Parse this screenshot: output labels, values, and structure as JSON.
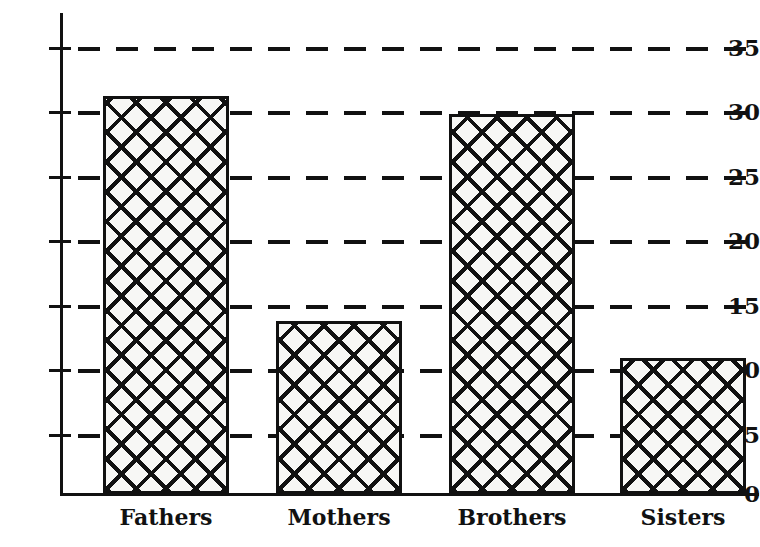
{
  "chart_data": {
    "type": "bar",
    "title": "",
    "subtitle": "",
    "xlabel": "",
    "ylabel": "",
    "categories": [
      "Fathers",
      "Mothers",
      "Brothers",
      "Sisters"
    ],
    "values": [
      31.2,
      13.6,
      29.8,
      10.7
    ],
    "series": [
      {
        "name": "",
        "values": [
          31.2,
          13.6,
          29.8,
          10.7
        ]
      }
    ],
    "ylim": [
      0,
      36
    ],
    "y_ticks": [
      0,
      5,
      10,
      15,
      20,
      25,
      30,
      35
    ],
    "y_tick_labels": [
      "0",
      "5",
      "10",
      "15",
      "20",
      "25",
      "30",
      "35"
    ],
    "grid": "horizontal-dashed",
    "gridlines_at": [
      5,
      10,
      15,
      20,
      25,
      30,
      35
    ],
    "legend": "none",
    "legend_position": "",
    "annotations": [],
    "bar_fill": "crosshatch",
    "colors": {
      "ink": "#111111",
      "bar_fill": "#f7f7f5",
      "background": "#ffffff"
    }
  }
}
